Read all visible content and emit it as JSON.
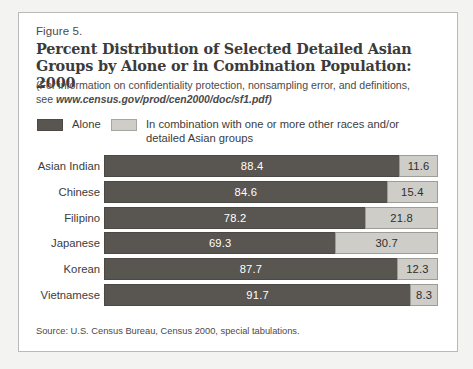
{
  "figure": {
    "number": "Figure 5.",
    "title": "Percent Distribution of Selected Detailed Asian Groups by Alone or in Combination Population: 2000",
    "note_line1": "(For information on confidentiality protection, nonsampling error, and definitions,",
    "note_prefix": "see ",
    "note_url": "www.census.gov/prod/cen2000/doc/sf1.pdf)",
    "source": "Source: U.S. Census Bureau, Census 2000, special tabulations."
  },
  "legend": {
    "alone": "Alone",
    "combination": "In combination with one or more other races and/or\ndetailed Asian groups"
  },
  "colors": {
    "alone": "#595550",
    "combination": "#cfcdc8",
    "panel_background": "#ffffff",
    "page_background": "#f3f3f2",
    "text": "#3c3c3c"
  },
  "chart_data": {
    "type": "bar",
    "orientation": "horizontal",
    "stacked": true,
    "normalized": true,
    "title": "Percent Distribution of Selected Detailed Asian Groups by Alone or in Combination Population: 2000",
    "xlabel": "",
    "ylabel": "",
    "xlim": [
      0,
      100
    ],
    "grid": false,
    "legend_position": "top-left",
    "categories": [
      "Asian Indian",
      "Chinese",
      "Filipino",
      "Japanese",
      "Korean",
      "Vietnamese"
    ],
    "series": [
      {
        "name": "Alone",
        "color": "#595550",
        "values": [
          88.4,
          84.6,
          78.2,
          69.3,
          87.7,
          91.7
        ]
      },
      {
        "name": "In combination with one or more other races and/or detailed Asian groups",
        "color": "#cfcdc8",
        "values": [
          11.6,
          15.4,
          21.8,
          30.7,
          12.3,
          8.3
        ]
      }
    ],
    "rows": [
      {
        "category": "Asian Indian",
        "alone": 88.4,
        "combination": 11.6
      },
      {
        "category": "Chinese",
        "alone": 84.6,
        "combination": 15.4
      },
      {
        "category": "Filipino",
        "alone": 78.2,
        "combination": 21.8
      },
      {
        "category": "Japanese",
        "alone": 69.3,
        "combination": 30.7
      },
      {
        "category": "Korean",
        "alone": 87.7,
        "combination": 12.3
      },
      {
        "category": "Vietnamese",
        "alone": 91.7,
        "combination": 8.3
      }
    ]
  }
}
